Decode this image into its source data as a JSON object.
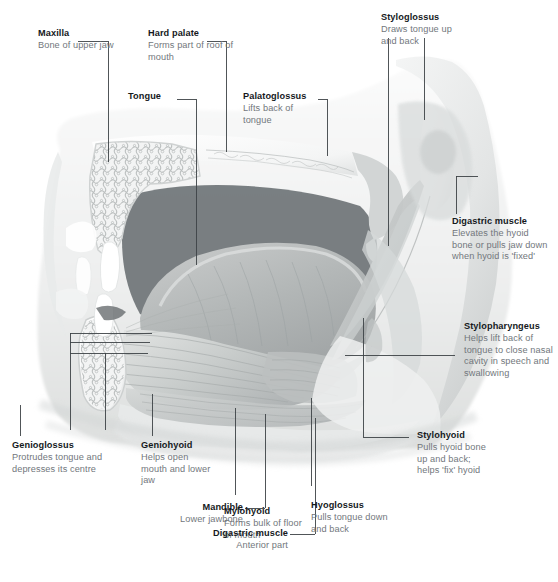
{
  "figure": {
    "kind": "anatomical-diagram",
    "width": 558,
    "height": 582,
    "palette": {
      "background": "#ffffff",
      "title_text": "#15191c",
      "description_text": "#72777c",
      "leader_line": "#3d4246",
      "tissue_light": "#f2f3f3",
      "tissue_mid": "#d9dbdb",
      "tissue_dark": "#a9adaf",
      "cavity_dark": "#6f7477",
      "bone_white": "#ffffff"
    }
  },
  "callouts": [
    {
      "id": "maxilla",
      "title": "Maxilla",
      "description": "Bone of upper jaw",
      "align": "left"
    },
    {
      "id": "hard-palate",
      "title": "Hard palate",
      "description": "Forms part of roof of mouth",
      "align": "left"
    },
    {
      "id": "tongue",
      "title": "Tongue",
      "description": "",
      "align": "left"
    },
    {
      "id": "palatoglossus",
      "title": "Palatoglossus",
      "description": "Lifts back of tongue",
      "align": "left"
    },
    {
      "id": "styloglossus",
      "title": "Styloglossus",
      "description": "Draws tongue up and back",
      "align": "left"
    },
    {
      "id": "digastric-muscle",
      "title": "Digastric muscle",
      "description": "Elevates the hyoid bone or pulls jaw down when hyoid is 'fixed'",
      "align": "left"
    },
    {
      "id": "stylopharyngeus",
      "title": "Stylopharyngeus",
      "description": "Helps lift back of tongue to close nasal cavity in speech and swallowing",
      "align": "left"
    },
    {
      "id": "stylohyoid",
      "title": "Stylohyoid",
      "description": "Pulls hyoid bone up and back; helps 'fix' hyoid",
      "align": "left"
    },
    {
      "id": "hyoglossus",
      "title": "Hyoglossus",
      "description": "Pulls tongue down and back",
      "align": "left"
    },
    {
      "id": "mylohyoid",
      "title": "Mylohyoid",
      "description": "Forms bulk of floor of mouth",
      "align": "left"
    },
    {
      "id": "digastric-muscle-anterior",
      "title": "Digastric muscle",
      "description": "Anterior part",
      "align": "right"
    },
    {
      "id": "mandible",
      "title": "Mandible",
      "description": "Lower jawbone",
      "align": "right"
    },
    {
      "id": "geniohyoid",
      "title": "Geniohyoid",
      "description": "Helps open mouth and lower jaw",
      "align": "left"
    },
    {
      "id": "genioglossus",
      "title": "Genioglossus",
      "description": "Protrudes tongue and depresses its centre",
      "align": "left"
    }
  ]
}
